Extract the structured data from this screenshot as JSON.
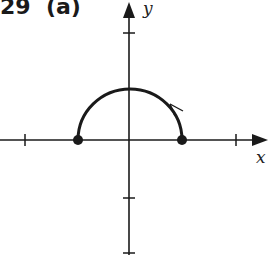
{
  "figure": {
    "label": "29  (a)",
    "x_axis_label": "x",
    "y_axis_label": "y",
    "stroke_color": "#1a1a1a",
    "curve": {
      "type": "upper semicircle",
      "center": [
        0,
        0
      ],
      "radius": 1,
      "endpoints": [
        [
          -1,
          0
        ],
        [
          1,
          0
        ]
      ],
      "endpoints_filled": true,
      "direction": "counterclockwise"
    },
    "x_ticks": [
      -2,
      -1,
      1,
      2
    ],
    "y_ticks": [
      2,
      -1,
      -2
    ]
  }
}
